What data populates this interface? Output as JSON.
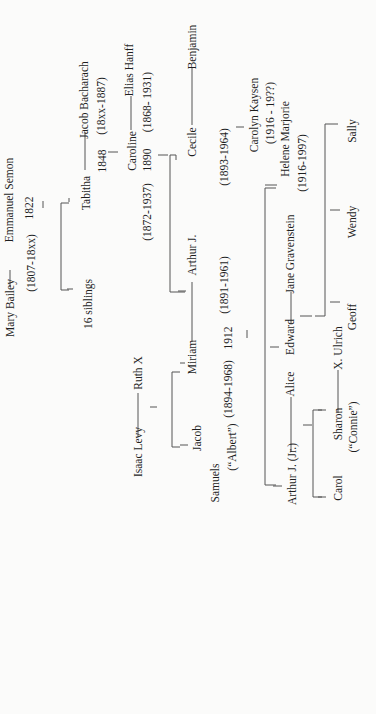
{
  "diagram": {
    "type": "family-tree",
    "orientation": "rotated-90-ccw",
    "background": "#fbfbfa",
    "line_color": "#555555",
    "people": [
      {
        "id": "mary_bailey",
        "name": "Mary Bailey",
        "dates": "(1807-18xx)"
      },
      {
        "id": "emmanuel_semon",
        "name": "Emmanuel Semon",
        "marriage_year": "1822"
      },
      {
        "id": "sixteen_siblings",
        "name": "16 siblings"
      },
      {
        "id": "tabitha",
        "name": "Tabitha",
        "marriage_year": "1848"
      },
      {
        "id": "jacob_bacharach",
        "name": "Jacob Bacharach",
        "dates": "(18xx-1887)"
      },
      {
        "id": "caroline",
        "name": "Caroline",
        "marriage_year": "1890",
        "dates": "(1872-1937)"
      },
      {
        "id": "elias_hanff",
        "name": "Elias Hanff",
        "dates": "(1868- 1931)"
      },
      {
        "id": "cecile",
        "name": "Cecile",
        "dates": "(1893-1964)"
      },
      {
        "id": "benjamin",
        "name": "Benjamin"
      },
      {
        "id": "arthur_j",
        "name": "Arthur J.",
        "dates": "(1891-1961)"
      },
      {
        "id": "isaac_levy",
        "name": "Isaac Levy"
      },
      {
        "id": "ruth_x",
        "name": "Ruth X"
      },
      {
        "id": "miriam",
        "name": "Miriam",
        "marriage_year": "1912",
        "dates": "(1894-1968)"
      },
      {
        "id": "jacob_samuels",
        "name": "Jacob",
        "surname": "Samuels",
        "nickname": "(“Albert”)"
      },
      {
        "id": "carolyn_kaysen",
        "name": "Carolyn Kaysen",
        "dates": "(1916 - 19??)"
      },
      {
        "id": "helene_marjorie",
        "name": "Helene Marjorie",
        "dates": "(1916-1997)"
      },
      {
        "id": "jane_gravenstein",
        "name": "Jane Gravenstein"
      },
      {
        "id": "edward",
        "name": "Edward"
      },
      {
        "id": "alice",
        "name": "Alice"
      },
      {
        "id": "arthur_j_jr",
        "name": "Arthur J. (Jr.)"
      },
      {
        "id": "sally",
        "name": "Sally"
      },
      {
        "id": "wendy",
        "name": "Wendy"
      },
      {
        "id": "geoff",
        "name": "Geoff"
      },
      {
        "id": "x_ulrich",
        "name": "X. Ulrich"
      },
      {
        "id": "sharon",
        "name": "Sharon",
        "nickname": "(“Connie”)"
      },
      {
        "id": "carol",
        "name": "Carol"
      }
    ],
    "marriages": [
      {
        "a": "Mary Bailey",
        "b": "Emmanuel Semon",
        "year": "1822"
      },
      {
        "a": "Tabitha",
        "b": "Jacob Bacharach",
        "year": "1848"
      },
      {
        "a": "Caroline",
        "b": "Elias Hanff",
        "year": "1890"
      },
      {
        "a": "Cecile",
        "b": "Benjamin"
      },
      {
        "a": "Isaac Levy",
        "b": "Ruth X"
      },
      {
        "a": "Miriam",
        "b": "Arthur J.",
        "year": "1912"
      },
      {
        "a": "Edward",
        "b": "Jane Gravenstein"
      },
      {
        "a": "Arthur J. (Jr.)",
        "b": "Alice"
      },
      {
        "a": "Sharon",
        "b": "X. Ulrich"
      }
    ]
  },
  "labels": {
    "mary_bailey": "Mary Bailey",
    "mary_bailey_dates": "(1807-18xx)",
    "emmanuel_semon": "Emmanuel Semon",
    "year_1822": "1822",
    "sixteen_siblings": "16 siblings",
    "tabitha": "Tabitha",
    "year_1848": "1848",
    "jacob_bacharach": "Jacob Bacharach",
    "jacob_bacharach_dates": "(18xx-1887)",
    "caroline": "Caroline",
    "year_1890": "1890",
    "caroline_dates": "(1872-1937)",
    "elias_hanff": "Elias Hanff",
    "elias_hanff_dates": "(1868- 1931)",
    "cecile": "Cecile",
    "cecile_dates": "(1893-1964)",
    "benjamin": "Benjamin",
    "arthur_j": "Arthur J.",
    "arthur_j_dates": "(1891-1961)",
    "isaac_levy": "Isaac Levy",
    "ruth_x": "Ruth X",
    "miriam": "Miriam",
    "year_1912": "1912",
    "miriam_dates": "(1894-1968)",
    "jacob": "Jacob",
    "samuels": "Samuels",
    "albert": "(“Albert”)",
    "carolyn_kaysen": "Carolyn Kaysen",
    "carolyn_kaysen_dates": "(1916 - 19??)",
    "helene_marjorie": "Helene Marjorie",
    "helene_marjorie_dates": "(1916-1997)",
    "jane_gravenstein": "Jane Gravenstein",
    "edward": "Edward",
    "alice": "Alice",
    "arthur_j_jr": "Arthur J. (Jr.)",
    "sally": "Sally",
    "wendy": "Wendy",
    "geoff": "Geoff",
    "x_ulrich": "X. Ulrich",
    "sharon": "Sharon",
    "connie": "(“Connie”)",
    "carol": "Carol"
  }
}
